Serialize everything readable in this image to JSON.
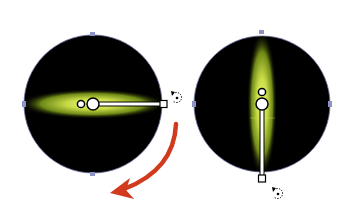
{
  "figure": {
    "left_panel": {
      "state": "horizontal gradient",
      "circle": {
        "cx": 93,
        "cy": 104,
        "r": 69
      },
      "glow": {
        "rx": 72,
        "ry": 14,
        "orientation": "horizontal"
      },
      "annotator": {
        "origin_x": 93,
        "origin_y": 104,
        "end_x": 163,
        "end_y": 104
      }
    },
    "right_panel": {
      "state": "vertical gradient",
      "circle": {
        "cx": 262,
        "cy": 104,
        "r": 68
      },
      "glow": {
        "rx": 14,
        "ry": 70,
        "orientation": "vertical"
      },
      "annotator": {
        "origin_x": 262,
        "origin_y": 104,
        "end_x": 262,
        "end_y": 178
      }
    },
    "arrow": {
      "color": "#d23a1e",
      "direction": "clockwise-down-left"
    },
    "icons": [
      "rotate-cursor-icon",
      "rotate-cursor-icon",
      "curved-arrow-icon"
    ]
  },
  "colors": {
    "background": "#ffffff",
    "circle_fill": "#000000",
    "glow_inner": "#e4ee6a",
    "glow_mid": "#9fb52a",
    "anchor_point": "#8c93c4",
    "annotator_stroke": "#000000",
    "annotator_fill": "#ffffff",
    "arrow": "#d23a1e"
  }
}
